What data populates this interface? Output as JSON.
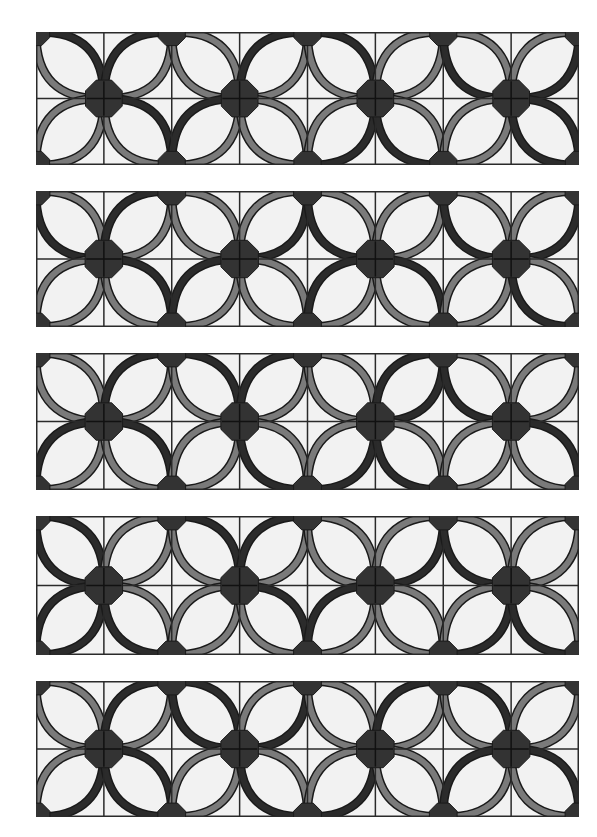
{
  "colors": {
    "background": "#f2f2f2",
    "grid": "#2a2a2a",
    "gray": "#7a7a7a",
    "dark": "#2b2b2b",
    "node": "#333333",
    "outline": "#1a1a1a"
  },
  "grid": {
    "cols": 8,
    "rows": 2
  },
  "panels": [
    {
      "name": "panel-1",
      "top": 32,
      "height": 133,
      "petals": [
        "gd",
        "dg",
        "gg",
        "dg",
        "gd",
        "gg",
        "dg",
        "gd",
        "gg",
        "dg",
        "gd",
        "gg",
        "dg",
        "gd",
        "gg",
        "dd"
      ]
    },
    {
      "name": "panel-2",
      "top": 191,
      "height": 136,
      "petals": [
        "dg",
        "dg",
        "gg",
        "gd",
        "dg",
        "gg",
        "dg",
        "gd",
        "gg",
        "dg",
        "gd",
        "gg",
        "gd",
        "dg",
        "gg",
        "gd"
      ]
    },
    {
      "name": "panel-3",
      "top": 353,
      "height": 137,
      "petals": [
        "gg",
        "dg",
        "gd",
        "dg",
        "gg",
        "dd",
        "dg",
        "gg",
        "gd",
        "dg",
        "gg",
        "gd",
        "dg",
        "gd",
        "gg",
        "dg"
      ]
    },
    {
      "name": "panel-4",
      "top": 516,
      "height": 139,
      "petals": [
        "dd",
        "gg",
        "gd",
        "dg",
        "gg",
        "gd",
        "dg",
        "gg",
        "dd",
        "gd",
        "gg",
        "dg",
        "gd",
        "gg",
        "dg",
        "gd"
      ]
    },
    {
      "name": "panel-5",
      "top": 681,
      "height": 136,
      "petals": [
        "gg",
        "dg",
        "dd",
        "gd",
        "gg",
        "dg",
        "gd",
        "gg",
        "dg",
        "dd",
        "gg",
        "gd",
        "dg",
        "gg",
        "gd",
        "dg"
      ]
    }
  ]
}
